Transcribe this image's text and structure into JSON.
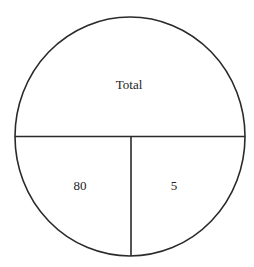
{
  "diagram": {
    "type": "number-bond",
    "top_cut_text": "",
    "colors": {
      "stroke": "#2a2a2a",
      "background": "#ffffff",
      "text": "#222222"
    },
    "whole": {
      "label": "Total"
    },
    "parts": [
      {
        "label": "80"
      },
      {
        "label": "5"
      }
    ]
  }
}
